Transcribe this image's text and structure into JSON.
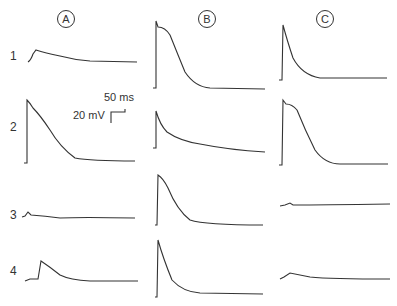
{
  "columns": [
    {
      "label": "A"
    },
    {
      "label": "B"
    },
    {
      "label": "C"
    }
  ],
  "rows": [
    {
      "label": "1"
    },
    {
      "label": "2"
    },
    {
      "label": "3"
    },
    {
      "label": "4"
    }
  ],
  "scale_bar": {
    "time": "50 ms",
    "voltage": "20 mV"
  },
  "trace_color": "#333333"
}
